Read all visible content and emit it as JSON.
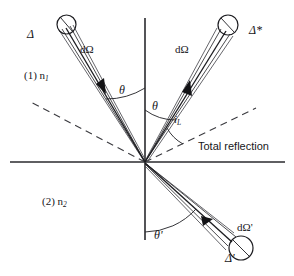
{
  "figure": {
    "background_color": "#ffffff",
    "line_color": "#17171a",
    "axes": {
      "origin": [
        145,
        162
      ],
      "vertical_axis": {
        "x": 145,
        "y_top": 18,
        "y_bottom": 240,
        "label": "surface-normal"
      },
      "horizontal_axis": {
        "y": 162,
        "x_left": 10,
        "x_right": 285,
        "label": "interface"
      }
    },
    "media": [
      {
        "index": "(1)",
        "refractive_index": "n",
        "subscript": "1",
        "region": "upper",
        "label": "(1) n₁"
      },
      {
        "index": "(2)",
        "refractive_index": "n",
        "subscript": "2",
        "region": "lower",
        "label": "(2) n₂"
      }
    ],
    "beams": [
      {
        "name": "incident-beam-left",
        "area_label": "Δ",
        "solid_angle_label": "dΩ",
        "angle_label": "θ",
        "quadrant": "upper-left",
        "arrow_direction": "toward-origin"
      },
      {
        "name": "reflected-beam-right",
        "area_label": "Δ*",
        "solid_angle_label": "dΩ",
        "angle_label": "θ",
        "quadrant": "upper-right",
        "arrow_direction": "away-from-origin"
      },
      {
        "name": "refracted-beam-lower",
        "area_label": "Δ'",
        "solid_angle_label": "dΩ'",
        "angle_label": "θ'",
        "quadrant": "lower-right",
        "arrow_direction": "away-from-origin"
      }
    ],
    "annotations": {
      "total_reflection": "Total reflection",
      "critical_angle": "i",
      "critical_angle_subscript": "L",
      "theta_left": "θ",
      "theta_right": "θ",
      "theta_prime": "θ'",
      "delta": "Δ",
      "delta_star": "Δ*",
      "delta_prime": "Δ'",
      "d_omega": "dΩ",
      "d_omega_prime": "dΩ'",
      "medium_1": "(1) n",
      "medium_1_sub": "1",
      "medium_2": "(2) n",
      "medium_2_sub": "2"
    },
    "dashed_lines": [
      {
        "name": "dashed-ray-upper-left",
        "from": [
          145,
          162
        ],
        "to": [
          29,
          101
        ]
      },
      {
        "name": "dashed-ray-upper-right",
        "from": [
          145,
          162
        ],
        "to": [
          256,
          108
        ]
      }
    ]
  }
}
